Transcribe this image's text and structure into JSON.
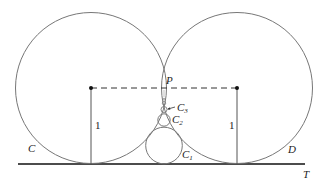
{
  "diagram": {
    "labels": {
      "circle_left": "C",
      "circle_right": "D",
      "tangent_line": "T",
      "touch_point": "P",
      "radius_left": "1",
      "radius_right": "1",
      "c1": {
        "base": "C",
        "sub": "1"
      },
      "c2": {
        "base": "C",
        "sub": "2"
      },
      "c3": {
        "base": "C",
        "sub": "3"
      }
    },
    "colors": {
      "stroke": "#777777",
      "dark": "#111111",
      "dashed": "#333333"
    }
  }
}
